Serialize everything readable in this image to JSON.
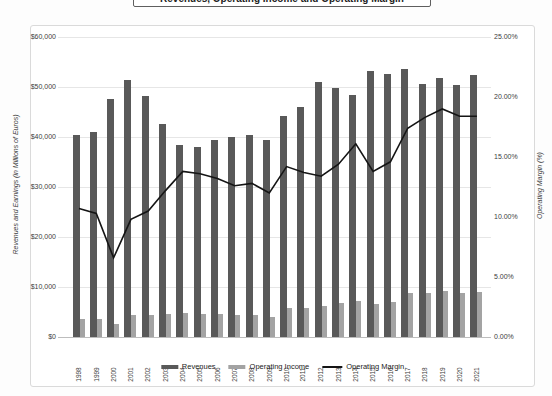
{
  "page": {
    "title": "Revenues, Operating Income and Operating Margin"
  },
  "chart_data": {
    "type": "combo-bar-line",
    "title": "Revenues, Operating Income and Operating Margin",
    "categories": [
      "1998",
      "1999",
      "2000",
      "2001",
      "2002",
      "2003",
      "2004",
      "2005",
      "2006",
      "2007",
      "2008",
      "2009",
      "2010",
      "2011",
      "2012",
      "2013",
      "2014",
      "2015",
      "2016",
      "2017",
      "2018",
      "2019",
      "2020",
      "2021"
    ],
    "series": [
      {
        "name": "Revenues",
        "type": "bar",
        "axis": "left",
        "color": "#595959",
        "values": [
          40400,
          41000,
          47600,
          51400,
          48300,
          42700,
          38400,
          38000,
          39500,
          40100,
          40400,
          39400,
          44300,
          46100,
          51100,
          49800,
          48400,
          53300,
          52600,
          53700,
          50600,
          51800,
          50400,
          52400
        ]
      },
      {
        "name": "Operating Income",
        "type": "bar",
        "axis": "left",
        "color": "#a3a3a3",
        "values": [
          3700,
          3700,
          2700,
          4500,
          4500,
          4700,
          4900,
          4700,
          4600,
          4500,
          4500,
          4100,
          5900,
          5900,
          6300,
          6900,
          7200,
          6700,
          7000,
          8900,
          8900,
          9300,
          8900,
          9100
        ]
      },
      {
        "name": "Operating Margin",
        "type": "line",
        "axis": "right",
        "color": "#151515",
        "values_percent": [
          10.7,
          10.3,
          6.6,
          9.8,
          10.5,
          12.2,
          13.8,
          13.6,
          13.2,
          12.6,
          12.8,
          12.0,
          14.2,
          13.7,
          13.4,
          14.4,
          16.1,
          13.8,
          14.6,
          17.4,
          18.3,
          19.0,
          18.4,
          18.4
        ]
      }
    ],
    "left_axis": {
      "label": "Revenues and Earnings (in Millions of Euros)",
      "ticks": [
        "$0",
        "$10,000",
        "$20,000",
        "$30,000",
        "$40,000",
        "$50,000",
        "$60,000"
      ],
      "min": 0,
      "max": 60000
    },
    "right_axis": {
      "label": "Operating Margin (%)",
      "ticks": [
        "0.00%",
        "5.00%",
        "10.00%",
        "15.00%",
        "20.00%",
        "25.00%"
      ],
      "min": 0,
      "max": 25
    },
    "legend": {
      "position": "bottom",
      "entries": [
        "Revenues",
        "Operating Income",
        "Operating Margin"
      ]
    },
    "grid": "horizontal"
  }
}
